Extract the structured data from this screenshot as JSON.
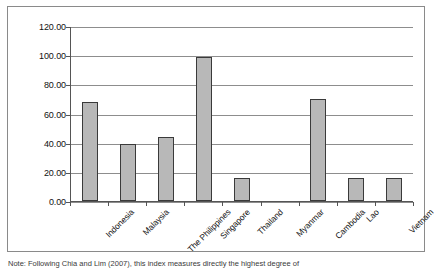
{
  "chart_data": {
    "type": "bar",
    "title": "",
    "subtitle": "",
    "xlabel": "",
    "ylabel": "",
    "categories": [
      "Indonesia",
      "Malaysia",
      "The Philippines",
      "Singapore",
      "Thailand",
      "Myanmar",
      "Cambodia",
      "Lao",
      "Vietnam"
    ],
    "values": [
      68.0,
      39.0,
      44.0,
      99.0,
      16.0,
      0.0,
      70.0,
      16.0,
      16.0
    ],
    "ylim": [
      0,
      120
    ],
    "ytick_values": [
      0,
      20,
      40,
      60,
      80,
      100,
      120
    ],
    "ytick_labels": [
      "0.00",
      "20.00",
      "40.00",
      "60.00",
      "80.00",
      "100.00",
      "120.00"
    ],
    "grid": true,
    "grid_axis": "y",
    "legend": false,
    "legend_position": "none",
    "bar_fill_color": "#b8b8b8",
    "bar_edge_color": "#3a3a3a",
    "gridline_color": "#8d8d8d",
    "axis_color": "#555555",
    "frame_color": "#8a8a8a",
    "xtick_label_rotation": -45
  },
  "footnote": {
    "text": "Note: Following Chia and Lim (2007), this index measures directly the highest degree of"
  }
}
